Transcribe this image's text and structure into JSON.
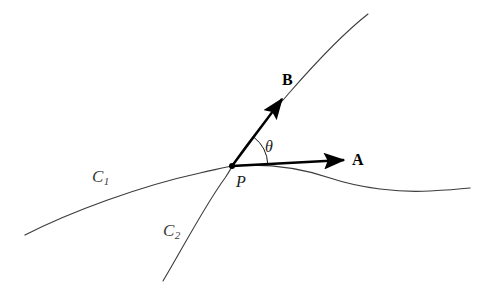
{
  "figure": {
    "kind": "geometry-diagram",
    "background_color": "#ffffff",
    "curve_color": "#3c3c3c",
    "vector_color": "#000000",
    "label_color": "#1a1a1a"
  },
  "curves": [
    {
      "id": "c1",
      "label": "C",
      "subscript": "1",
      "label_x": 92,
      "label_y": 168,
      "path": "M 25 235 C 70 212, 140 186, 200 173 C 218 169, 226 167, 232 166 C 270 163, 300 168, 330 178 C 360 188, 400 193, 430 191 C 448 190, 460 189, 470 188",
      "stroke_width": 1.25
    },
    {
      "id": "c2",
      "label": "C",
      "subscript": "2",
      "label_x": 163,
      "label_y": 222,
      "path": "M 163 281 C 180 253, 205 205, 225 178 C 229 172, 231 169, 232 166 C 243 148, 262 124, 290 92 C 318 60, 345 32, 368 14",
      "stroke_width": 1.1
    }
  ],
  "intersection_point": {
    "label": "P",
    "x": 232,
    "y": 166,
    "dot_radius": 3.0,
    "label_x": 236,
    "label_y": 174
  },
  "vectors": [
    {
      "id": "a",
      "label": "A",
      "from_x": 232,
      "from_y": 166,
      "to_x": 344,
      "to_y": 160,
      "label_x": 352,
      "label_y": 152,
      "stroke_width": 2.4
    },
    {
      "id": "b",
      "label": "B",
      "from_x": 232,
      "from_y": 166,
      "to_x": 282,
      "to_y": 99,
      "label_x": 282,
      "label_y": 72,
      "stroke_width": 2.4
    }
  ],
  "angle": {
    "label": "θ",
    "vertex_x": 232,
    "vertex_y": 166,
    "radius": 36,
    "arc_path": "M 267.8 164.1 A 36 36 0 0 0 253.6 137.0",
    "label_x": 265,
    "label_y": 139,
    "stroke_width": 1.0
  }
}
